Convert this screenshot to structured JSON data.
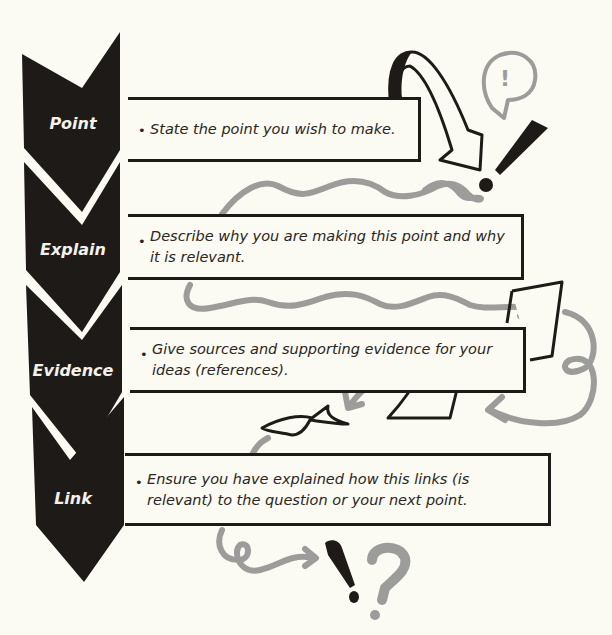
{
  "diagram": {
    "stages": [
      {
        "label": "Point",
        "text": "State the point you wish to make."
      },
      {
        "label": "Explain",
        "text": "Describe why you are making this point and why it is relevant."
      },
      {
        "label": "Evidence",
        "text": "Give sources and supporting evidence for your ideas (references)."
      },
      {
        "label": "Link",
        "text": "Ensure you have explained how this links (is relevant) to the question or your next point."
      }
    ],
    "bullet": "•",
    "decorations": {
      "speech_bubble_glyph": "!",
      "end_glyphs": [
        "!",
        "?"
      ]
    },
    "colors": {
      "background": "#fbfaf3",
      "chevron": "#1e1a18",
      "label_text": "#f4f1ea",
      "squiggle": "#9c9c9a",
      "outline": "#1e1a18"
    }
  }
}
